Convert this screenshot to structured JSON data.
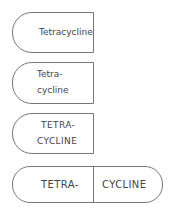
{
  "capsules": [
    {
      "label": "Tetracycline"
    },
    {
      "line1": "Tetra-",
      "line2": "cycline"
    },
    {
      "line1": "TETRA-",
      "line2": "CYCLINE"
    },
    {
      "left": "TETRA-",
      "right": "CYCLINE"
    }
  ]
}
